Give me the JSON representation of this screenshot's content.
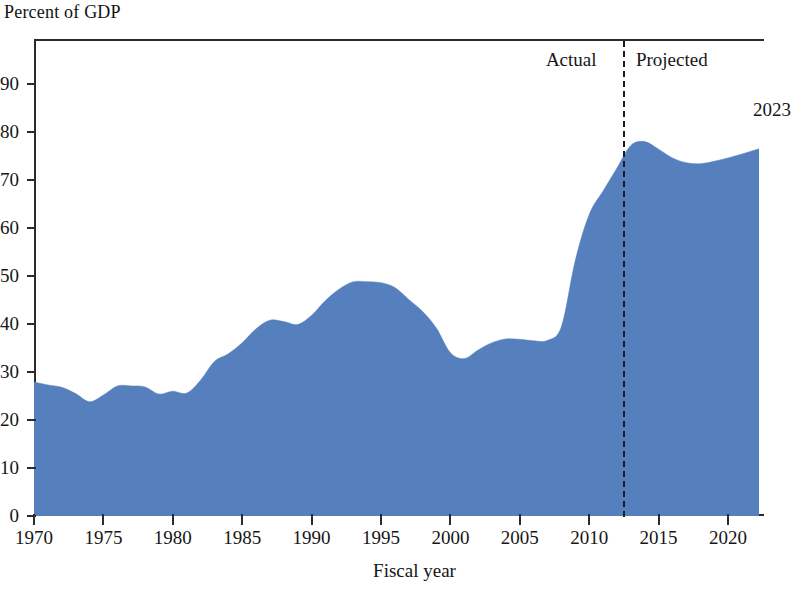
{
  "chart_data": {
    "type": "area",
    "title": "Percent of GDP",
    "xlabel": "Fiscal year",
    "ylabel": "Percent of GDP",
    "xlim": [
      1970,
      2023
    ],
    "ylim": [
      0,
      95
    ],
    "grid": false,
    "legend_position": "none",
    "fill_color": "#5580BD",
    "axis_color": "#2b2b2b",
    "x_ticks": [
      1970,
      1975,
      1980,
      1985,
      1990,
      1995,
      2000,
      2005,
      2010,
      2015,
      2020
    ],
    "y_ticks": [
      0,
      10,
      20,
      30,
      40,
      50,
      60,
      70,
      80,
      90
    ],
    "annotations": [
      {
        "name": "actual-label",
        "text": "Actual",
        "x": 2011,
        "y": 88
      },
      {
        "name": "projected-label",
        "text": "Projected",
        "x": 2014,
        "y": 88
      },
      {
        "name": "end-year-label",
        "text": "2023",
        "x": 2022,
        "y": 78
      }
    ],
    "divider": {
      "x": 2012.5,
      "style": "dashed"
    },
    "x": [
      1970,
      1971,
      1972,
      1973,
      1974,
      1975,
      1976,
      1977,
      1978,
      1979,
      1980,
      1981,
      1982,
      1983,
      1984,
      1985,
      1986,
      1987,
      1988,
      1989,
      1990,
      1991,
      1992,
      1993,
      1994,
      1995,
      1996,
      1997,
      1998,
      1999,
      2000,
      2001,
      2002,
      2003,
      2004,
      2005,
      2006,
      2007,
      2008,
      2009,
      2010,
      2011,
      2012,
      2013,
      2014,
      2015,
      2016,
      2017,
      2018,
      2019,
      2020,
      2021,
      2022,
      2023
    ],
    "values": [
      27.9,
      27.3,
      26.8,
      25.5,
      23.8,
      25.2,
      27.1,
      27.1,
      26.9,
      25.4,
      26.0,
      25.6,
      28.3,
      32.2,
      33.8,
      36.1,
      39.0,
      40.8,
      40.5,
      39.9,
      41.8,
      44.9,
      47.3,
      48.8,
      48.8,
      48.6,
      47.6,
      45.1,
      42.6,
      39.1,
      34.0,
      32.8,
      34.6,
      36.1,
      36.9,
      36.8,
      36.5,
      36.6,
      39.5,
      53.3,
      62.8,
      67.7,
      72.5,
      77.2,
      78.0,
      76.4,
      74.6,
      73.6,
      73.4,
      73.9,
      74.6,
      75.4,
      76.3,
      77.1
    ]
  },
  "chart": {
    "title": "Percent of GDP",
    "xaxis_title": "Fiscal year",
    "y_tick_labels": [
      "90",
      "80",
      "70",
      "60",
      "50",
      "40",
      "30",
      "20",
      "10",
      "0"
    ],
    "x_tick_labels": [
      "1970",
      "1975",
      "1980",
      "1985",
      "1990",
      "1995",
      "2000",
      "2005",
      "2010",
      "2015",
      "2020"
    ],
    "actual_label": "Actual",
    "projected_label": "Projected",
    "end_year_label": "2023"
  }
}
